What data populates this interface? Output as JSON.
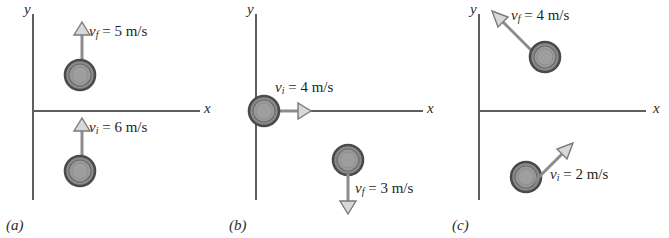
{
  "figure": {
    "type": "physics-vector-diagram",
    "style": {
      "background": "#ffffff",
      "axis_color": "#5e5e5e",
      "arrow_color": "#8c8c8c",
      "arrow_outline": "#6b6b6b",
      "ball_outline": "#4a4a4a",
      "ball_fill": "#8e8e8e",
      "text_color": "#1f1f1f"
    },
    "panels": [
      {
        "tag": "(a)",
        "axes": {
          "x_label": "x",
          "y_label": "y"
        },
        "vectors": [
          {
            "name": "v_f",
            "symbol": "v",
            "subscript": "f",
            "equals": "= 5 m/s",
            "label": "v_f = 5 m/s",
            "magnitude": 5,
            "unit": "m/s",
            "direction": "up",
            "angle_deg": 90,
            "position": "above x-axis"
          },
          {
            "name": "v_i",
            "symbol": "v",
            "subscript": "i",
            "equals": "= 6 m/s",
            "label": "v_i = 6 m/s",
            "magnitude": 6,
            "unit": "m/s",
            "direction": "up",
            "angle_deg": 90,
            "position": "below x-axis"
          }
        ]
      },
      {
        "tag": "(b)",
        "axes": {
          "x_label": "x",
          "y_label": "y"
        },
        "vectors": [
          {
            "name": "v_i",
            "symbol": "v",
            "subscript": "i",
            "equals": "= 4 m/s",
            "label": "v_i = 4 m/s",
            "magnitude": 4,
            "unit": "m/s",
            "direction": "right",
            "angle_deg": 0,
            "position": "on x-axis at origin"
          },
          {
            "name": "v_f",
            "symbol": "v",
            "subscript": "f",
            "equals": "= 3 m/s",
            "label": "v_f = 3 m/s",
            "magnitude": 3,
            "unit": "m/s",
            "direction": "down",
            "angle_deg": 270,
            "position": "below x-axis"
          }
        ]
      },
      {
        "tag": "(c)",
        "axes": {
          "x_label": "x",
          "y_label": "y"
        },
        "vectors": [
          {
            "name": "v_f",
            "symbol": "v",
            "subscript": "f",
            "equals": "= 4 m/s",
            "label": "v_f = 4 m/s",
            "magnitude": 4,
            "unit": "m/s",
            "direction": "up-left",
            "angle_deg": 135,
            "position": "above x-axis"
          },
          {
            "name": "v_i",
            "symbol": "v",
            "subscript": "i",
            "equals": "= 2 m/s",
            "label": "v_i = 2 m/s",
            "magnitude": 2,
            "unit": "m/s",
            "direction": "up-right",
            "angle_deg": 45,
            "position": "below x-axis"
          }
        ]
      }
    ]
  }
}
